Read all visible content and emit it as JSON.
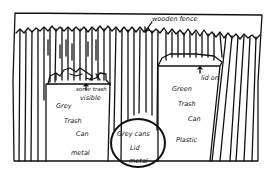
{
  "sketch": {
    "type": "hand-drawn diagram",
    "background": "#ffffff",
    "ink": "#111111",
    "labels": {
      "fence": "wooden fence",
      "trash_visible_1": "some trash",
      "trash_visible_2": "visible",
      "lid_on": "lid on",
      "grey_can_1": "Grey",
      "grey_can_2": "Trash",
      "grey_can_3": "Can",
      "grey_can_material": "metal",
      "green_can_1": "Green",
      "green_can_2": "Trash",
      "green_can_3": "Can",
      "green_can_material": "Plastic",
      "lid_1": "Grey cans",
      "lid_2": "Lid",
      "lid_3": "metal"
    }
  }
}
